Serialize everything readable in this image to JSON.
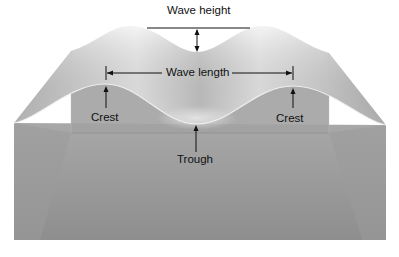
{
  "diagram": {
    "labels": {
      "wave_height": "Wave height",
      "wave_length": "Wave length",
      "crest_left": "Crest",
      "crest_right": "Crest",
      "trough": "Trough"
    },
    "colors": {
      "background": "#ffffff",
      "top_surface_light": "#f4f4f4",
      "top_surface_shade": "#b9b9b9",
      "front_face": "#a9a9a9",
      "inner_panel": "#9f9f9f",
      "body_lower": "#909090",
      "line": "#111111"
    }
  }
}
